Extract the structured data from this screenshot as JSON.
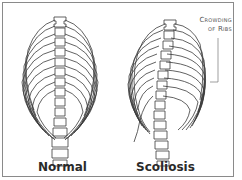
{
  "figure": {
    "panels": [
      {
        "label": "Normal"
      },
      {
        "label": "Scoliosis"
      }
    ],
    "annotation": {
      "line1": "Crowding",
      "line2": "of Ribs"
    },
    "colors": {
      "stroke": "#3a3a3a",
      "frame": "#8a8a8a",
      "background": "#ffffff"
    }
  }
}
